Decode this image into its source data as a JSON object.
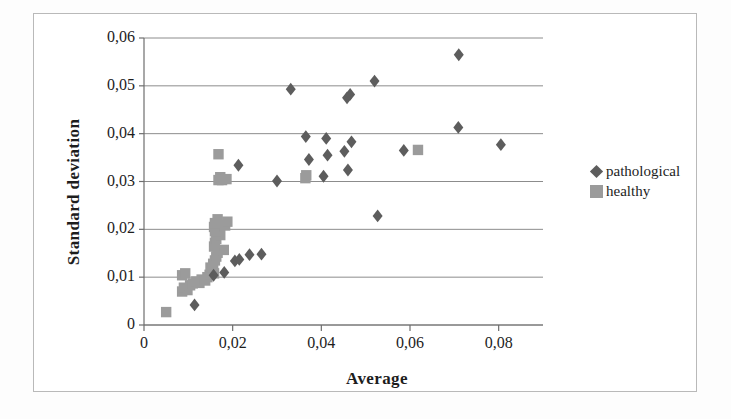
{
  "chart_data": {
    "type": "scatter",
    "title": "",
    "xlabel": "Average",
    "ylabel": "Standard deviation",
    "xlim": [
      0,
      0.09
    ],
    "ylim": [
      0,
      0.06
    ],
    "xticks": [
      0,
      0.02,
      0.04,
      0.06,
      0.08
    ],
    "xtick_labels": [
      "0",
      "0,02",
      "0,04",
      "0,06",
      "0,08"
    ],
    "yticks": [
      0,
      0.01,
      0.02,
      0.03,
      0.04,
      0.05,
      0.06
    ],
    "ytick_labels": [
      "0",
      "0,01",
      "0,02",
      "0,03",
      "0,04",
      "0,05",
      "0,06"
    ],
    "grid": "horizontal",
    "legend_position": "right",
    "decimal_separator": ",",
    "series": [
      {
        "name": "pathological",
        "marker": "diamond",
        "color": "#5d5d5d",
        "points": [
          [
            0.0114,
            0.0042
          ],
          [
            0.0157,
            0.0104
          ],
          [
            0.0181,
            0.011
          ],
          [
            0.0205,
            0.0134
          ],
          [
            0.0215,
            0.0137
          ],
          [
            0.0238,
            0.0147
          ],
          [
            0.0265,
            0.0148
          ],
          [
            0.0527,
            0.0228
          ],
          [
            0.03,
            0.0301
          ],
          [
            0.0405,
            0.0311
          ],
          [
            0.046,
            0.0324
          ],
          [
            0.0213,
            0.0334
          ],
          [
            0.0372,
            0.0346
          ],
          [
            0.0414,
            0.0355
          ],
          [
            0.0452,
            0.0363
          ],
          [
            0.0586,
            0.0365
          ],
          [
            0.0805,
            0.0377
          ],
          [
            0.0468,
            0.0383
          ],
          [
            0.0411,
            0.039
          ],
          [
            0.0365,
            0.0394
          ],
          [
            0.0709,
            0.0413
          ],
          [
            0.0458,
            0.0475
          ],
          [
            0.0465,
            0.0482
          ],
          [
            0.0331,
            0.0493
          ],
          [
            0.052,
            0.051
          ],
          [
            0.071,
            0.0565
          ]
        ]
      },
      {
        "name": "healthy",
        "marker": "square",
        "color": "#9b9b9b",
        "points": [
          [
            0.005,
            0.0027
          ],
          [
            0.0086,
            0.007
          ],
          [
            0.009,
            0.0078
          ],
          [
            0.0098,
            0.0073
          ],
          [
            0.0104,
            0.0083
          ],
          [
            0.011,
            0.0087
          ],
          [
            0.0118,
            0.0091
          ],
          [
            0.0125,
            0.0088
          ],
          [
            0.013,
            0.0095
          ],
          [
            0.0138,
            0.0093
          ],
          [
            0.0143,
            0.01
          ],
          [
            0.0086,
            0.0104
          ],
          [
            0.0093,
            0.0108
          ],
          [
            0.0148,
            0.0105
          ],
          [
            0.0152,
            0.0112
          ],
          [
            0.0158,
            0.0108
          ],
          [
            0.015,
            0.012
          ],
          [
            0.0156,
            0.0128
          ],
          [
            0.016,
            0.0135
          ],
          [
            0.0163,
            0.0143
          ],
          [
            0.0166,
            0.0151
          ],
          [
            0.018,
            0.0157
          ],
          [
            0.0158,
            0.0164
          ],
          [
            0.016,
            0.0172
          ],
          [
            0.0163,
            0.018
          ],
          [
            0.0172,
            0.0188
          ],
          [
            0.016,
            0.0196
          ],
          [
            0.0158,
            0.0205
          ],
          [
            0.016,
            0.0213
          ],
          [
            0.0183,
            0.0208
          ],
          [
            0.0188,
            0.0216
          ],
          [
            0.0166,
            0.0221
          ],
          [
            0.0168,
            0.0303
          ],
          [
            0.0172,
            0.0309
          ],
          [
            0.0176,
            0.0303
          ],
          [
            0.0186,
            0.0305
          ],
          [
            0.0364,
            0.0307
          ],
          [
            0.0366,
            0.0313
          ],
          [
            0.0168,
            0.0357
          ],
          [
            0.0618,
            0.0366
          ]
        ]
      }
    ]
  },
  "legend": {
    "entries": [
      {
        "label": "pathological",
        "marker": "diamond",
        "color": "#5d5d5d"
      },
      {
        "label": "healthy",
        "marker": "square",
        "color": "#9b9b9b"
      }
    ]
  },
  "axes": {
    "x_title": "Average",
    "y_title": "Standard deviation"
  },
  "colors": {
    "pathological": "#5d5d5d",
    "healthy": "#9b9b9b",
    "gridline": "#8c8c8c",
    "axis": "#6e6e6e",
    "frame": "#b9b9b9",
    "text": "#1d1d1d",
    "background": "#ffffff"
  }
}
